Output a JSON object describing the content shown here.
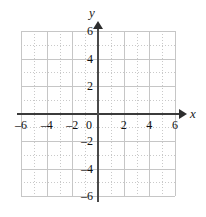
{
  "chart_data": {
    "type": "scatter",
    "title": "",
    "subtitle": "",
    "xlabel": "x",
    "ylabel": "y",
    "xlim": [
      -6,
      6
    ],
    "ylim": [
      -6,
      6
    ],
    "x_major_step": 2,
    "y_major_step": 2,
    "x_minor_step": 1,
    "y_minor_step": 1,
    "grid": true,
    "grid_style": "solid major at even integers, dotted minor at odd integers",
    "legend": "none",
    "series": [],
    "values": [],
    "annotations": [],
    "x_tick_labels": [
      "–6",
      "–4",
      "–2",
      "0",
      "2",
      "4",
      "6"
    ],
    "x_tick_values": [
      -6,
      -4,
      -2,
      0,
      2,
      4,
      6
    ],
    "y_tick_labels": [
      "6",
      "4",
      "2",
      "–2",
      "–4",
      "–6"
    ],
    "y_tick_values": [
      6,
      4,
      2,
      -2,
      -4,
      -6
    ],
    "minor_tick_values": [
      -5,
      -3,
      -1,
      1,
      3,
      5
    ],
    "origin_label": "0",
    "axis_arrows": [
      "x-positive",
      "y-positive"
    ],
    "colors": {
      "background": "#ffffff",
      "axis": "#3b3b3b",
      "grid_major": "#c6c6c6",
      "grid_minor": "#c9c9c9",
      "tick_label": "#111111",
      "axis_label": "#1a1a1a"
    }
  },
  "axes": {
    "x_label": "x",
    "y_label": "y"
  },
  "ticks": {
    "x": [
      {
        "value": -6,
        "label": "–6"
      },
      {
        "value": -4,
        "label": "–4"
      },
      {
        "value": -2,
        "label": "–2"
      },
      {
        "value": 2,
        "label": "2"
      },
      {
        "value": 4,
        "label": "4"
      },
      {
        "value": 6,
        "label": "6"
      }
    ],
    "y": [
      {
        "value": 6,
        "label": "6"
      },
      {
        "value": 4,
        "label": "4"
      },
      {
        "value": 2,
        "label": "2"
      },
      {
        "value": -2,
        "label": "–2"
      },
      {
        "value": -4,
        "label": "–4"
      },
      {
        "value": -6,
        "label": "–6"
      }
    ],
    "origin": "0"
  }
}
